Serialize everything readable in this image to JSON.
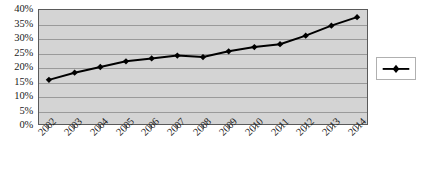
{
  "chart_data": {
    "type": "line",
    "title": "",
    "xlabel": "",
    "ylabel": "",
    "categories": [
      "2002",
      "2003",
      "2004",
      "2005",
      "2006",
      "2007",
      "2008",
      "2009",
      "2010",
      "2011",
      "2012",
      "2013",
      "2014"
    ],
    "values": [
      15.5,
      18,
      20,
      22,
      23,
      24,
      23.5,
      25.5,
      27,
      28,
      31,
      34.5,
      37.5
    ],
    "series": [
      {
        "name": "Series 1",
        "values": [
          15.5,
          18,
          20,
          22,
          23,
          24,
          23.5,
          25.5,
          27,
          28,
          31,
          34.5,
          37.5
        ]
      }
    ],
    "ylim": [
      0,
      40
    ],
    "ytick_values": [
      0,
      5,
      10,
      15,
      20,
      25,
      30,
      35,
      40
    ],
    "ytick_labels": [
      "0%",
      "5%",
      "10%",
      "15%",
      "20%",
      "25%",
      "30%",
      "35%",
      "40%"
    ],
    "grid": true,
    "legend_position": "right",
    "legend_entries": [
      ""
    ],
    "marker": "diamond",
    "line_color": "#000000",
    "marker_color": "#000000",
    "plot_background": "#d4d4d4",
    "gridline_color": "#9a9a9a"
  }
}
